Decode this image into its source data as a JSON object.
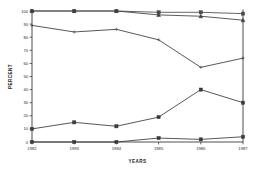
{
  "chart_data": {
    "type": "line",
    "title": "",
    "xlabel": "YEARS",
    "ylabel": "PERCENT",
    "categories": [
      "1982",
      "1983",
      "1984",
      "1985",
      "1986",
      "1987"
    ],
    "x": [
      1982,
      1983,
      1984,
      1985,
      1986,
      1987
    ],
    "ylim": [
      0,
      100
    ],
    "yticks": [
      0,
      10,
      20,
      30,
      40,
      50,
      60,
      70,
      80,
      90,
      100
    ],
    "ytick_labels": [
      "0",
      "10",
      "20",
      "30",
      "40",
      "50",
      "60",
      "70",
      "80",
      "90",
      "100"
    ],
    "grid": false,
    "legend": "none",
    "series": [
      {
        "name": "series-1",
        "marker": "square",
        "color": "#4a4a4a",
        "values": [
          100,
          100,
          100,
          99,
          99,
          98
        ]
      },
      {
        "name": "series-2",
        "marker": "triangle",
        "color": "#3d3d3d",
        "values": [
          100,
          100,
          100,
          97,
          96,
          93
        ]
      },
      {
        "name": "series-3",
        "marker": "plus",
        "color": "#3a3a3a",
        "values": [
          89,
          84,
          86,
          78,
          57,
          64
        ]
      },
      {
        "name": "series-4",
        "marker": "square",
        "color": "#3a3a3a",
        "values": [
          10,
          15,
          12,
          19,
          40,
          30
        ]
      },
      {
        "name": "series-5",
        "marker": "square",
        "color": "#3a3a3a",
        "values": [
          0,
          0,
          0,
          3,
          2,
          4
        ]
      }
    ]
  },
  "axes": {
    "y_title": "PERCENT",
    "x_title": "YEARS"
  }
}
